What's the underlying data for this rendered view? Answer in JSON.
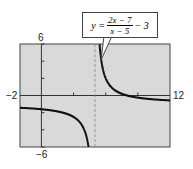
{
  "chart_data": {
    "type": "line",
    "title": "",
    "function": "y = (2x - 7)/(x - 5) - 3",
    "equation_label": {
      "lhs": "y =",
      "numerator": "2x − 7",
      "denominator": "x − 5",
      "tail": "− 3"
    },
    "xlim": [
      -2,
      12
    ],
    "ylim": [
      -6,
      6
    ],
    "x_tick_labels": [
      "-2",
      "12"
    ],
    "y_tick_labels": [
      "6",
      "-6"
    ],
    "vertical_asymptote": 5,
    "horizontal_asymptote": -1,
    "grid": false,
    "background": "#d9d9d9",
    "curve_color": "#111111"
  },
  "labels": {
    "xmin": "−2",
    "xmax": "12",
    "ymax": "6",
    "ymin": "−6"
  }
}
